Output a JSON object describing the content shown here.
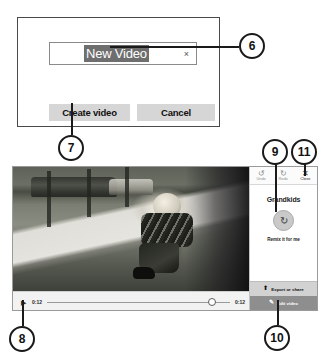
{
  "create_dialog": {
    "name_field": {
      "value": "New Video",
      "placeholder": "Enter a video name",
      "clear_glyph": "×"
    },
    "create_button": "Create video",
    "cancel_button": "Cancel"
  },
  "video_window": {
    "toolbar": [
      {
        "name": "undo",
        "label": "Undo",
        "glyph": "↺",
        "enabled": false
      },
      {
        "name": "redo",
        "label": "Redo",
        "glyph": "↻",
        "enabled": false
      },
      {
        "name": "close",
        "label": "Close",
        "glyph": "✕",
        "enabled": true
      }
    ],
    "project_title": "Grandkids",
    "remix_icon_glyph": "↻",
    "remix_label": "Remix it for me",
    "export_button": {
      "label": "Export or share",
      "glyph": "⬆"
    },
    "edit_button": {
      "label": "Edit video",
      "glyph": "✎"
    },
    "playback": {
      "play_glyph": "▶",
      "current_time": "0:12",
      "total_time": "0:12",
      "progress_percent": 90
    }
  },
  "callouts": [
    {
      "id": "6",
      "number": "6"
    },
    {
      "id": "7",
      "number": "7"
    },
    {
      "id": "8",
      "number": "8"
    },
    {
      "id": "9",
      "number": "9"
    },
    {
      "id": "10",
      "number": "10"
    },
    {
      "id": "11",
      "number": "11"
    }
  ]
}
